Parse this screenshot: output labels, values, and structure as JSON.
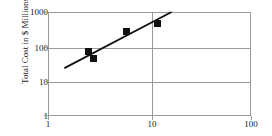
{
  "chart_data": {
    "type": "scatter",
    "title": "",
    "xlabel": "",
    "ylabel": "Total Cost in $ Millions",
    "xscale": "log",
    "yscale": "log",
    "xlim": [
      1,
      100
    ],
    "ylim": [
      1,
      1000
    ],
    "xticks": [
      "1",
      "10",
      "100"
    ],
    "xtick_values": [
      1,
      10,
      100
    ],
    "yticks": [
      "1000",
      "100",
      "10",
      "1"
    ],
    "ytick_values": [
      1000,
      100,
      10,
      1
    ],
    "grid": true,
    "legend": "none",
    "series": [
      {
        "name": "data",
        "marker": "filled-square",
        "color": "#111111",
        "points": [
          {
            "x": 2.5,
            "y": 72
          },
          {
            "x": 2.8,
            "y": 47
          },
          {
            "x": 6.0,
            "y": 280
          },
          {
            "x": 12.0,
            "y": 480
          }
        ]
      },
      {
        "name": "trend-line",
        "type": "line",
        "color": "#111111",
        "points": [
          {
            "x": 1.45,
            "y": 24
          },
          {
            "x": 16.5,
            "y": 1000
          }
        ]
      }
    ],
    "frame_color": "#9a9a9a",
    "accent": "#111111"
  },
  "axis": {
    "y_title": "Total Cost in $ Millions",
    "y_labels": [
      "1000",
      "100",
      "10",
      "1"
    ],
    "x_labels": [
      "1",
      "10",
      "100"
    ]
  }
}
